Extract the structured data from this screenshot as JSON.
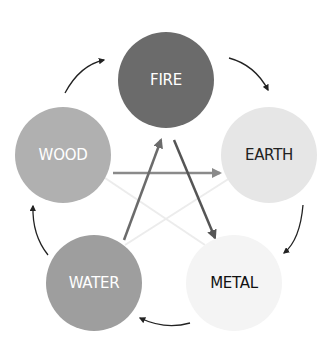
{
  "diagram": {
    "nodes": [
      {
        "id": "fire",
        "label": "FIRE",
        "cx": 166,
        "cy": 80,
        "r": 48,
        "fill": "#6b6b6b",
        "text_color": "#ffffff"
      },
      {
        "id": "earth",
        "label": "EARTH",
        "cx": 269,
        "cy": 155,
        "r": 48,
        "fill": "#e6e6e6",
        "text_color": "#222222"
      },
      {
        "id": "metal",
        "label": "METAL",
        "cx": 234,
        "cy": 283,
        "r": 48,
        "fill": "#f4f4f4",
        "text_color": "#111111"
      },
      {
        "id": "water",
        "label": "WATER",
        "cx": 94,
        "cy": 283,
        "r": 48,
        "fill": "#9e9e9e",
        "text_color": "#ffffff"
      },
      {
        "id": "wood",
        "label": "WOOD",
        "cx": 63,
        "cy": 155,
        "r": 48,
        "fill": "#b0b0b0",
        "text_color": "#ffffff"
      }
    ],
    "generating_cycle": [
      "wood",
      "fire",
      "earth",
      "metal",
      "water",
      "wood"
    ],
    "inner_arrows": [
      {
        "from": "wood",
        "to": "earth",
        "color": "#8a8a8a"
      },
      {
        "from": "water",
        "to": "fire",
        "color": "#6b6b6b"
      },
      {
        "from": "fire",
        "to": "metal",
        "color": "#555555"
      },
      {
        "from": "wood",
        "to": "metal",
        "color": "#eeeeee"
      },
      {
        "from": "earth",
        "to": "water",
        "color": "#eeeeee"
      }
    ]
  }
}
